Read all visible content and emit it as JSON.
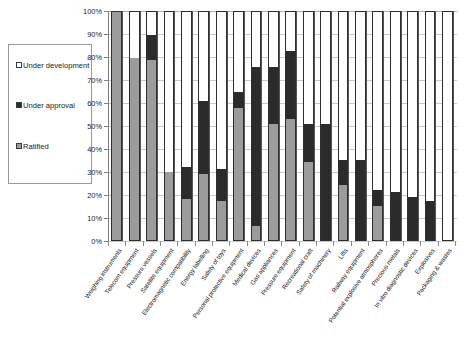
{
  "chart_data": {
    "type": "bar",
    "title": "",
    "subtitle": "",
    "xlabel": "",
    "ylabel": "",
    "stacked": true,
    "stack_total_percent": 100,
    "grid": true,
    "legend_position": "left",
    "ylim": [
      0,
      100
    ],
    "ytick_labels": [
      "100%",
      "90%",
      "80%",
      "70%",
      "60%",
      "50%",
      "40%",
      "30%",
      "20%",
      "10%",
      "0%"
    ],
    "ytick_values": [
      100,
      90,
      80,
      70,
      60,
      50,
      40,
      30,
      20,
      10,
      0
    ],
    "categories": [
      "Weighing instruments",
      "Telecom equipment",
      "Pressure vessels",
      "Satellite equipment",
      "Electromagnetic compatibility",
      "Energy labelling",
      "Safety of toys",
      "Personal protective equipment",
      "Medical devices",
      "Gas appliances",
      "Pressure equipment",
      "Recreational craft",
      "Safety of machinery",
      "Lifts",
      "Railway equipment",
      "Potential explosive atmospheres",
      "Precious metals",
      "In vitro diagnostic devices",
      "Explosives",
      "Packaging & wastes"
    ],
    "series": [
      {
        "name": "Ratified",
        "color": "#9c9c9c",
        "values": [
          100,
          80,
          79,
          30,
          18,
          29,
          17,
          58,
          6,
          51,
          53,
          34,
          0,
          24,
          0,
          15,
          0,
          0,
          0,
          0
        ]
      },
      {
        "name": "Under approval",
        "color": "#2b2b2b",
        "values": [
          0,
          0,
          11,
          0,
          14,
          32,
          14,
          7,
          70,
          25,
          30,
          17,
          51,
          11,
          35,
          7,
          21,
          19,
          17,
          0
        ]
      },
      {
        "name": "Under development",
        "color": "#ffffff",
        "values": [
          0,
          20,
          10,
          70,
          68,
          39,
          69,
          35,
          24,
          24,
          17,
          49,
          49,
          65,
          65,
          78,
          79,
          81,
          83,
          100
        ]
      }
    ]
  },
  "legend": {
    "items": [
      {
        "label": "Under development",
        "swatch": "#ffffff",
        "icon": "legend-swatch-white"
      },
      {
        "label": "Under approval",
        "swatch": "#2b2b2b",
        "icon": "legend-swatch-black"
      },
      {
        "label": "Ratified",
        "swatch": "#9c9c9c",
        "icon": "legend-swatch-gray"
      }
    ]
  }
}
